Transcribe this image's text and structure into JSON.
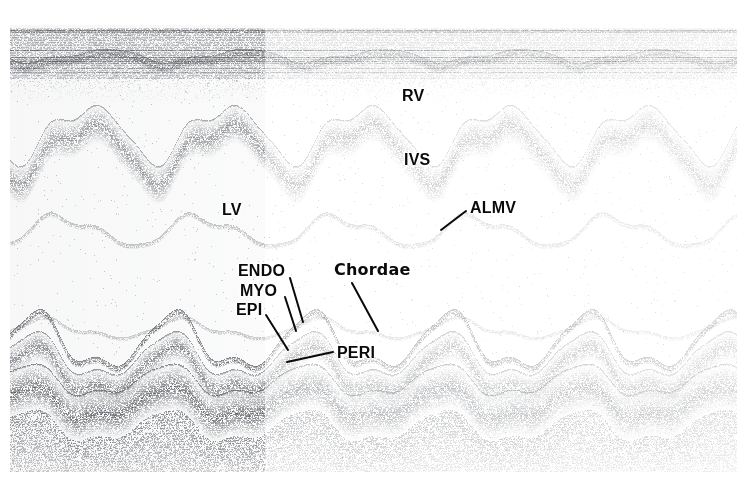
{
  "image": {
    "kind": "m-mode-echocardiogram",
    "width": 747,
    "height": 482,
    "background_color": "#ffffff",
    "ink_color": "#0a0a0a",
    "scan_tint": "#6b6f74",
    "left_panel_boundary_x": 265,
    "top_band": {
      "y_start": 28,
      "y_end": 78
    },
    "scan_area": {
      "x": 10,
      "y": 25,
      "width": 727,
      "height": 447
    }
  },
  "annotations": [
    {
      "id": "rv",
      "label": "RV",
      "x": 402,
      "y": 88,
      "leader": null
    },
    {
      "id": "ivs",
      "label": "IVS",
      "x": 404,
      "y": 152,
      "leader": null
    },
    {
      "id": "almv",
      "label": "ALMV",
      "x": 470,
      "y": 200,
      "leader": {
        "x1": 466,
        "y1": 211,
        "x2": 441,
        "y2": 230
      }
    },
    {
      "id": "lv",
      "label": "LV",
      "x": 222,
      "y": 202,
      "leader": null
    },
    {
      "id": "endo",
      "label": "ENDO",
      "x": 238,
      "y": 263,
      "leader": {
        "x1": 290,
        "y1": 278,
        "x2": 303,
        "y2": 322
      }
    },
    {
      "id": "myo",
      "label": "MYO",
      "x": 240,
      "y": 283,
      "leader": {
        "x1": 285,
        "y1": 297,
        "x2": 296,
        "y2": 331
      }
    },
    {
      "id": "epi",
      "label": "EPI",
      "x": 236,
      "y": 302,
      "leader": {
        "x1": 266,
        "y1": 315,
        "x2": 288,
        "y2": 350
      }
    },
    {
      "id": "chordae",
      "label": "Chordae",
      "x": 334,
      "y": 262,
      "leader": {
        "x1": 352,
        "y1": 283,
        "x2": 378,
        "y2": 331
      }
    },
    {
      "id": "peri",
      "label": "PERI",
      "x": 337,
      "y": 345,
      "leader": {
        "x1": 333,
        "y1": 352,
        "x2": 287,
        "y2": 362
      }
    }
  ],
  "chart_data": {
    "type": "heatmap",
    "title": "",
    "xlabel": "",
    "ylabel": "",
    "series": [
      {
        "name": "rv-anterior-wall",
        "baseline_y": 60,
        "amplitude": 6,
        "period": 138,
        "phase": 0,
        "thickness": 10,
        "density": 0.55
      },
      {
        "name": "ivs-band",
        "baseline_y": 150,
        "amplitude": 26,
        "period": 138,
        "phase": 0.12,
        "thickness": 38,
        "density": 0.5
      },
      {
        "name": "mitral-leaflet",
        "baseline_y": 232,
        "amplitude": 14,
        "period": 138,
        "phase": 0.3,
        "thickness": 5,
        "density": 0.35
      },
      {
        "name": "chordae-trace",
        "baseline_y": 330,
        "amplitude": 9,
        "period": 138,
        "phase": 0.42,
        "thickness": 4,
        "density": 0.3
      },
      {
        "name": "endocardium",
        "baseline_y": 346,
        "amplitude": 26,
        "period": 138,
        "phase": 0.5,
        "thickness": 7,
        "density": 0.75
      },
      {
        "name": "myocardium",
        "baseline_y": 372,
        "amplitude": 21,
        "period": 138,
        "phase": 0.52,
        "thickness": 30,
        "density": 0.6
      },
      {
        "name": "pericardium",
        "baseline_y": 404,
        "amplitude": 15,
        "period": 138,
        "phase": 0.55,
        "thickness": 46,
        "density": 0.7
      }
    ],
    "cycles": 5,
    "grid": false,
    "legend": "none"
  }
}
